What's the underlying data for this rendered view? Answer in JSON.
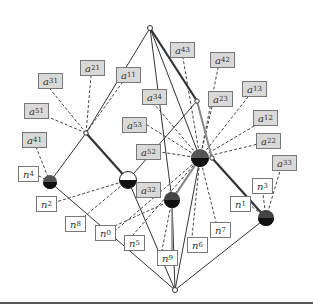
{
  "diagram": {
    "type": "graph",
    "a_labels": [
      {
        "id": "a43",
        "base": "a",
        "sub": "43",
        "x": 170,
        "y": 42
      },
      {
        "id": "a42",
        "base": "a",
        "sub": "42",
        "x": 210,
        "y": 52
      },
      {
        "id": "a21",
        "base": "a",
        "sub": "21",
        "x": 80,
        "y": 60
      },
      {
        "id": "a11",
        "base": "a",
        "sub": "11",
        "x": 116,
        "y": 67
      },
      {
        "id": "a31",
        "base": "a",
        "sub": "31",
        "x": 38,
        "y": 73
      },
      {
        "id": "a13",
        "base": "a",
        "sub": "13",
        "x": 242,
        "y": 81
      },
      {
        "id": "a34",
        "base": "a",
        "sub": "34",
        "x": 142,
        "y": 89
      },
      {
        "id": "a23",
        "base": "a",
        "sub": "23",
        "x": 208,
        "y": 91
      },
      {
        "id": "a51",
        "base": "a",
        "sub": "51",
        "x": 24,
        "y": 103
      },
      {
        "id": "a53",
        "base": "a",
        "sub": "53",
        "x": 122,
        "y": 117
      },
      {
        "id": "a12",
        "base": "a",
        "sub": "12",
        "x": 253,
        "y": 110
      },
      {
        "id": "a41",
        "base": "a",
        "sub": "41",
        "x": 22,
        "y": 132
      },
      {
        "id": "a22",
        "base": "a",
        "sub": "22",
        "x": 256,
        "y": 133
      },
      {
        "id": "a52",
        "base": "a",
        "sub": "52",
        "x": 136,
        "y": 144
      },
      {
        "id": "a32",
        "base": "a",
        "sub": "32",
        "x": 136,
        "y": 182
      },
      {
        "id": "a33",
        "base": "a",
        "sub": "33",
        "x": 272,
        "y": 155
      }
    ],
    "n_labels": [
      {
        "id": "n4",
        "base": "n",
        "sub": "4",
        "x": 18,
        "y": 166
      },
      {
        "id": "n2",
        "base": "n",
        "sub": "2",
        "x": 36,
        "y": 196
      },
      {
        "id": "n3",
        "base": "n",
        "sub": "3",
        "x": 252,
        "y": 178
      },
      {
        "id": "n1",
        "base": "n",
        "sub": "1",
        "x": 230,
        "y": 196
      },
      {
        "id": "n8",
        "base": "n",
        "sub": "8",
        "x": 65,
        "y": 216
      },
      {
        "id": "n0",
        "base": "n",
        "sub": "0",
        "x": 95,
        "y": 225
      },
      {
        "id": "n5",
        "base": "n",
        "sub": "5",
        "x": 124,
        "y": 235
      },
      {
        "id": "n7",
        "base": "n",
        "sub": "7",
        "x": 210,
        "y": 222
      },
      {
        "id": "n6",
        "base": "n",
        "sub": "6",
        "x": 187,
        "y": 237
      },
      {
        "id": "n9",
        "base": "n",
        "sub": "9",
        "x": 157,
        "y": 250
      }
    ],
    "nodes": [
      {
        "id": "top",
        "kind": "small",
        "x": 150,
        "y": 28
      },
      {
        "id": "bottom",
        "kind": "small",
        "x": 175,
        "y": 290
      },
      {
        "id": "jl",
        "kind": "small",
        "x": 86,
        "y": 133
      },
      {
        "id": "jr",
        "kind": "small",
        "x": 197,
        "y": 101
      },
      {
        "id": "jr2",
        "kind": "small",
        "x": 212,
        "y": 158
      },
      {
        "id": "L",
        "kind": "dark",
        "x": 50,
        "y": 182
      },
      {
        "id": "H",
        "kind": "half",
        "x": 128,
        "y": 180
      },
      {
        "id": "B",
        "kind": "dark",
        "x": 200,
        "y": 158
      },
      {
        "id": "M",
        "kind": "dark",
        "x": 172,
        "y": 200
      },
      {
        "id": "R",
        "kind": "dark",
        "x": 266,
        "y": 218
      }
    ]
  }
}
